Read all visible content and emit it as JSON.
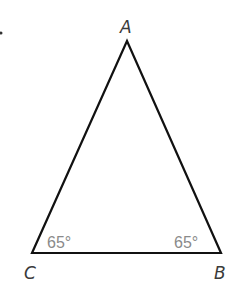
{
  "diagram": {
    "type": "triangle",
    "vertices": [
      {
        "label": "A",
        "x": 127,
        "y": 41
      },
      {
        "label": "B",
        "x": 221,
        "y": 253
      },
      {
        "label": "C",
        "x": 32,
        "y": 253
      }
    ],
    "angles": [
      {
        "vertex": "C",
        "label": "65°"
      },
      {
        "vertex": "B",
        "label": "65°"
      }
    ],
    "stroke_color": "#111111",
    "label_color": "#3a3a3a",
    "angle_label_color": "#8a8a8a"
  }
}
